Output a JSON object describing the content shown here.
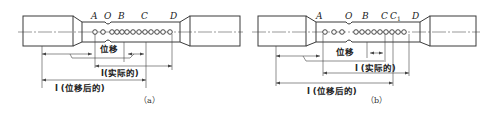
{
  "figure": {
    "panels": [
      {
        "id": "a",
        "caption": "（a）",
        "points": [
          {
            "name": "A",
            "x": 95
          },
          {
            "name": "O",
            "x": 108
          },
          {
            "name": "B",
            "x": 122
          },
          {
            "name": "C",
            "x": 145
          },
          {
            "name": "D",
            "x": 172
          }
        ],
        "dots_x": [
          95,
          103,
          112,
          117,
          122,
          127,
          133,
          139,
          145,
          151,
          157,
          163,
          170
        ],
        "neck_x": 108,
        "labels": {
          "displacement": "位移",
          "l_actual": "l(实际的)",
          "l_after": "l (位移后的)"
        }
      },
      {
        "id": "b",
        "caption": "（b）",
        "points": [
          {
            "name": "A",
            "x": 322
          },
          {
            "name": "O",
            "x": 349
          },
          {
            "name": "B",
            "x": 366
          },
          {
            "name": "C",
            "x": 385
          },
          {
            "name": "C1",
            "x": 394
          },
          {
            "name": "D",
            "x": 415
          }
        ],
        "dots_x": [
          325,
          334,
          342,
          356,
          362,
          368,
          374,
          380,
          386,
          392,
          398,
          404
        ],
        "neck_x": 349,
        "labels": {
          "displacement": "位移",
          "l_actual": "l (实际的)",
          "l_after": "l (位移后的)"
        }
      }
    ]
  }
}
